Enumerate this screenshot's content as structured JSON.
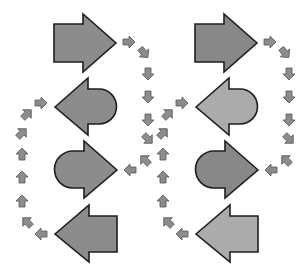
{
  "diagram": {
    "colors": {
      "background": "#ffffff",
      "big_arrow_dark": "#8a8a8a",
      "big_arrow_light": "#ababab",
      "small_arrow": "#8c8c8c",
      "outline": "#1e1e1e"
    },
    "columns": [
      {
        "name": "left-cycle",
        "offset_x": 0,
        "arrows": [
          {
            "id": "arrow-1",
            "shape": "block-right",
            "fill": "#8c8c8c"
          },
          {
            "id": "arrow-2",
            "shape": "rounded-left",
            "fill": "#8c8c8c"
          },
          {
            "id": "arrow-3",
            "shape": "rounded-right",
            "fill": "#8c8c8c"
          },
          {
            "id": "arrow-4",
            "shape": "block-left",
            "fill": "#8c8c8c"
          }
        ]
      },
      {
        "name": "right-cycle",
        "offset_x": 141,
        "arrows": [
          {
            "id": "arrow-1",
            "shape": "block-right",
            "fill": "#888888"
          },
          {
            "id": "arrow-2",
            "shape": "rounded-left",
            "fill": "#ababab"
          },
          {
            "id": "arrow-3",
            "shape": "rounded-right",
            "fill": "#888888"
          },
          {
            "id": "arrow-4",
            "shape": "block-left",
            "fill": "#ababab"
          }
        ]
      }
    ],
    "small_arrows": [
      {
        "x": 129,
        "y": 42,
        "rot": 0
      },
      {
        "x": 144,
        "y": 53,
        "rot": 50
      },
      {
        "x": 148,
        "y": 74,
        "rot": 90
      },
      {
        "x": 148,
        "y": 97,
        "rot": 90
      },
      {
        "x": 148,
        "y": 120,
        "rot": 90
      },
      {
        "x": 148,
        "y": 139,
        "rot": 45
      },
      {
        "x": 130,
        "y": 170,
        "rot": 180
      },
      {
        "x": 145,
        "y": 160,
        "rot": 225
      },
      {
        "x": 41,
        "y": 234,
        "rot": 180
      },
      {
        "x": 27,
        "y": 222,
        "rot": 225
      },
      {
        "x": 22,
        "y": 201,
        "rot": 270
      },
      {
        "x": 22,
        "y": 177,
        "rot": 270
      },
      {
        "x": 22,
        "y": 154,
        "rot": 270
      },
      {
        "x": 22,
        "y": 133,
        "rot": 315
      },
      {
        "x": 27,
        "y": 114,
        "rot": 315
      },
      {
        "x": 41,
        "y": 103,
        "rot": 0
      }
    ]
  }
}
